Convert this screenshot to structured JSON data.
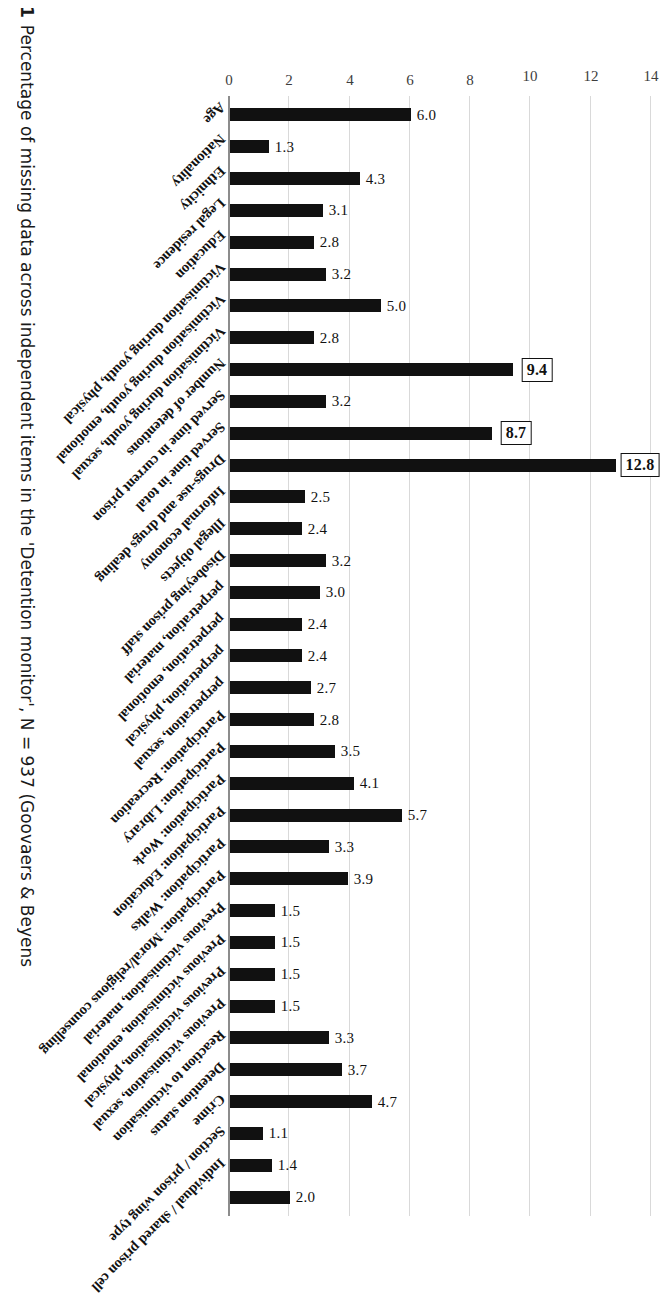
{
  "caption": {
    "number": "1",
    "text": "Percentage of missing data across independent items in the 'Detention monitor', N = 937 (Goovaers & Beyens"
  },
  "axis": {
    "yticks": [
      "0",
      "2",
      "4",
      "6",
      "8",
      "10",
      "12",
      "14"
    ],
    "ymin": 0,
    "ymax": 14,
    "ylabel": "",
    "xlabel": ""
  },
  "chart_data": {
    "type": "bar",
    "title": "Percentage of missing data across independent items in the 'Detention monitor', N = 937",
    "xlabel": "",
    "ylabel": "",
    "ylim": [
      0,
      14
    ],
    "yticks": [
      0,
      2,
      4,
      6,
      8,
      10,
      12,
      14
    ],
    "grid": true,
    "legend": "none",
    "orientation": "vertical-bars-rotated-figure",
    "categories": [
      "Age",
      "Nationality",
      "Ethnicity",
      "Legal residence",
      "Education",
      "Victimisation during youth, physical",
      "Victimisation during youth, emotional",
      "Victimisation during youth, sexual",
      "Number of detentions",
      "Served time in current prison",
      "Served time in total",
      "Drugs-use and drugs dealing",
      "Informal economy",
      "Illegal objects",
      "Disobeying prison staff",
      "perpetration, material",
      "perpetration, emotional",
      "perpetration, physical",
      "perpetration, sexual",
      "Participation: Recreation",
      "Participation: Library",
      "Participation: Work",
      "Participation: Education",
      "Participation: Walks",
      "Participation: Moral/religious counselling",
      "Previous victimisation, material",
      "Previous victimisation, emotional",
      "Previous victimisation, physical",
      "Previous victimisation, sexual",
      "Reaction to victimisation",
      "Detention status",
      "Crime",
      "Section / prison wing type",
      "Individual / shared prison cell",
      ""
    ],
    "values": [
      6.0,
      1.3,
      4.3,
      3.1,
      2.8,
      3.2,
      5.0,
      2.8,
      9.4,
      3.2,
      8.7,
      12.8,
      2.5,
      2.4,
      3.2,
      3.0,
      2.4,
      2.4,
      2.7,
      2.8,
      3.5,
      4.1,
      5.7,
      3.3,
      3.9,
      1.5,
      1.5,
      1.5,
      1.5,
      3.3,
      3.7,
      4.7,
      1.1,
      1.4,
      2.0
    ],
    "labels": [
      "6.0",
      "1.3",
      "4.3",
      "3.1",
      "2.8",
      "3.2",
      "5.0",
      "2.8",
      "9.4",
      "3.2",
      "8.7",
      "12.8",
      "2.5",
      "2.4",
      "3.2",
      "3.0",
      "2.4",
      "2.4",
      "2.7",
      "2.8",
      "3.5",
      "4.1",
      "5.7",
      "3.3",
      "3.9",
      "1.5",
      "1.5",
      "1.5",
      "1.5",
      "3.3",
      "3.7",
      "4.7",
      "1.1",
      "1.4",
      "2.0"
    ],
    "highlighted": [
      false,
      false,
      false,
      false,
      false,
      false,
      false,
      false,
      true,
      false,
      true,
      true,
      false,
      false,
      false,
      false,
      false,
      false,
      false,
      false,
      false,
      false,
      false,
      false,
      false,
      false,
      false,
      false,
      false,
      false,
      false,
      false,
      false,
      false,
      false
    ],
    "bar_color": "#111111",
    "highlight_box_color": "#111111"
  }
}
